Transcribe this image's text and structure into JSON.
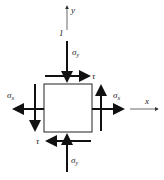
{
  "diagram": {
    "type": "plane stress element",
    "axes": {
      "x": "x",
      "y": "y"
    },
    "labels": {
      "sigma_y_top": "σ",
      "sigma_y_top_sub": "y",
      "sigma_y_bottom": "σ",
      "sigma_y_bottom_sub": "y",
      "sigma_x_left": "σ",
      "sigma_x_left_sub": "x",
      "sigma_x_right": "σ",
      "sigma_x_right_sub": "x",
      "tau_top": "τ",
      "tau_bottom": "τ",
      "marker": "1"
    }
  }
}
